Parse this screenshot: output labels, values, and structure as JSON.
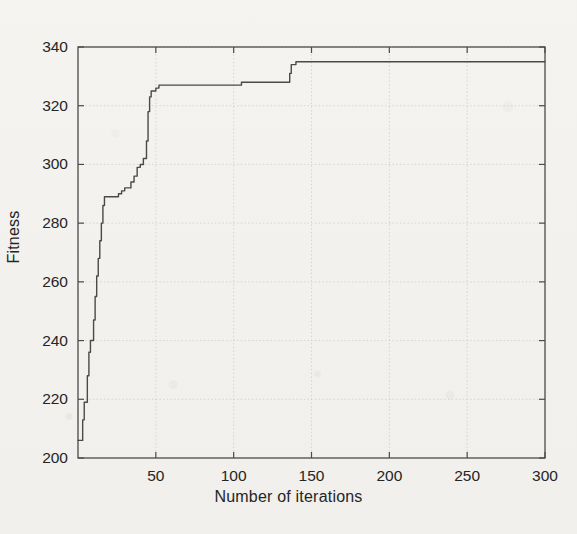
{
  "figure": {
    "background_color": "#f3f2ef",
    "ink_color": "#4a4a4a",
    "grid_color": "#c9c9c4",
    "plot_box": {
      "left": 78,
      "top": 47,
      "right": 545,
      "bottom": 458
    }
  },
  "chart_data": {
    "type": "line",
    "title": "",
    "xlabel": "Number of iterations",
    "ylabel": "Fitness",
    "xlim": [
      0,
      300
    ],
    "ylim": [
      200,
      340
    ],
    "xticks": [
      50,
      100,
      150,
      200,
      250,
      300
    ],
    "yticks": [
      200,
      220,
      240,
      260,
      280,
      300,
      320,
      340
    ],
    "xtick_labels": [
      "50",
      "100",
      "150",
      "200",
      "250",
      "300"
    ],
    "ytick_labels": [
      "200",
      "220",
      "240",
      "260",
      "280",
      "300",
      "320",
      "340"
    ],
    "grid": true,
    "legend": null,
    "series": [
      {
        "name": "Best fitness",
        "color": "#4a4a4a",
        "line_width": 1.4,
        "x": [
          0,
          1,
          2,
          3,
          4,
          5,
          6,
          7,
          8,
          9,
          10,
          11,
          12,
          13,
          14,
          15,
          16,
          17,
          18,
          19,
          20,
          22,
          24,
          26,
          28,
          30,
          32,
          34,
          36,
          38,
          40,
          41,
          42,
          43,
          44,
          45,
          46,
          47,
          48,
          50,
          52,
          55,
          60,
          70,
          80,
          90,
          100,
          104,
          105,
          110,
          120,
          130,
          135,
          136,
          137,
          140,
          150,
          170,
          190,
          210,
          230,
          250,
          270,
          290,
          300
        ],
        "y": [
          206,
          206,
          206,
          213,
          219,
          219,
          228,
          236,
          240,
          240,
          247,
          255,
          262,
          268,
          274,
          280,
          286,
          289,
          289,
          289,
          289,
          289,
          289,
          290,
          291,
          292,
          292,
          294,
          296,
          299,
          300,
          300,
          302,
          302,
          308,
          318,
          323,
          325,
          325,
          326,
          327,
          327,
          327,
          327,
          327,
          327,
          327,
          327,
          328,
          328,
          328,
          328,
          328,
          331,
          334,
          335,
          335,
          335,
          335,
          335,
          335,
          335,
          335,
          335,
          335
        ]
      }
    ]
  }
}
